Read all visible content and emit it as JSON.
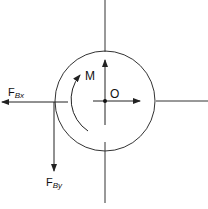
{
  "diagram": {
    "type": "free-body-diagram",
    "labels": {
      "moment": "M",
      "origin": "O",
      "fbx_main": "F",
      "fbx_sub": "Bx",
      "fby_main": "F",
      "fby_sub": "By"
    },
    "colors": {
      "stroke": "#222222",
      "background": "#ffffff"
    }
  }
}
